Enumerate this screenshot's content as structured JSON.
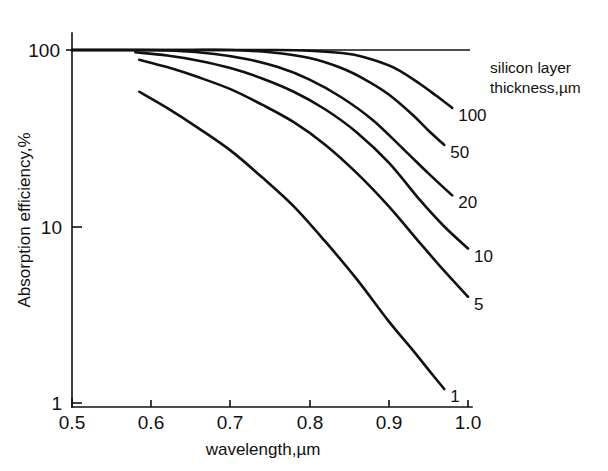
{
  "chart_data": {
    "type": "line",
    "title": "",
    "xlabel": "wavelength,µm",
    "ylabel": "Absorption efficiency,%",
    "xlim": [
      0.5,
      1.0
    ],
    "ylim": [
      1,
      100
    ],
    "yscale": "log",
    "xscale": "linear",
    "grid": false,
    "legend_position": "right-of-curves",
    "legend_title_line1": "silicon layer",
    "legend_title_line2": "thickness,µm",
    "xticks": [
      "0.5",
      "0.6",
      "0.7",
      "0.8",
      "0.9",
      "1.0"
    ],
    "xtick_values": [
      0.5,
      0.6,
      0.7,
      0.8,
      0.9,
      1.0
    ],
    "yticks": [
      "1",
      "10",
      "100"
    ],
    "ytick_values": [
      1,
      10,
      100
    ],
    "annotations": [
      {
        "text": "100",
        "series": "100"
      },
      {
        "text": "50",
        "series": "50"
      },
      {
        "text": "20",
        "series": "20"
      },
      {
        "text": "10",
        "series": "10"
      },
      {
        "text": "5",
        "series": "5"
      },
      {
        "text": "1",
        "series": "1"
      }
    ],
    "series": [
      {
        "name": "100",
        "label": "100",
        "x": [
          0.5,
          0.6,
          0.65,
          0.7,
          0.75,
          0.8,
          0.85,
          0.88,
          0.91,
          0.94,
          0.96,
          0.98
        ],
        "values": [
          100,
          100,
          100,
          100,
          100,
          99,
          95,
          88,
          78,
          64,
          55,
          47
        ]
      },
      {
        "name": "50",
        "label": "50",
        "x": [
          0.5,
          0.6,
          0.65,
          0.7,
          0.75,
          0.8,
          0.84,
          0.87,
          0.9,
          0.93,
          0.95,
          0.97
        ],
        "values": [
          100,
          100,
          100,
          100,
          97,
          90,
          79,
          68,
          56,
          43,
          35,
          29
        ]
      },
      {
        "name": "20",
        "label": "20",
        "x": [
          0.5,
          0.58,
          0.63,
          0.68,
          0.72,
          0.76,
          0.8,
          0.84,
          0.88,
          0.92,
          0.95,
          0.98
        ],
        "values": [
          100,
          100,
          99,
          95,
          89,
          80,
          68,
          54,
          40,
          27,
          20,
          15
        ]
      },
      {
        "name": "10",
        "label": "10",
        "x": [
          0.58,
          0.62,
          0.66,
          0.7,
          0.74,
          0.78,
          0.82,
          0.86,
          0.9,
          0.94,
          0.97,
          1.0
        ],
        "values": [
          97,
          93,
          87,
          79,
          69,
          58,
          46,
          34,
          23,
          14,
          10,
          7.5
        ]
      },
      {
        "name": "5",
        "label": "5",
        "x": [
          0.585,
          0.62,
          0.66,
          0.7,
          0.74,
          0.78,
          0.82,
          0.86,
          0.9,
          0.94,
          0.97,
          1.0
        ],
        "values": [
          88,
          80,
          70,
          60,
          49,
          39,
          29,
          20,
          13,
          8.0,
          5.6,
          4.0
        ]
      },
      {
        "name": "1",
        "label": "1",
        "x": [
          0.585,
          0.62,
          0.66,
          0.7,
          0.74,
          0.78,
          0.82,
          0.86,
          0.9,
          0.93,
          0.955,
          0.97
        ],
        "values": [
          58,
          47,
          36,
          27,
          19,
          13,
          8.2,
          5.0,
          2.9,
          2.0,
          1.45,
          1.2
        ]
      }
    ]
  }
}
